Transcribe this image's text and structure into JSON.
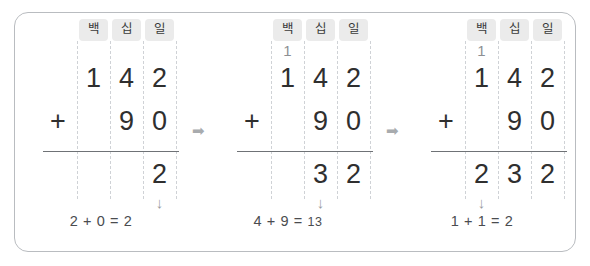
{
  "problem": {
    "addend_top": "142",
    "addend_bottom": "90",
    "total": "232",
    "operator": "+"
  },
  "place_headers": {
    "hundreds": "백",
    "tens": "십",
    "ones": "일"
  },
  "separator": {
    "arrow": "➡"
  },
  "down_arrow": "↓",
  "steps": [
    {
      "name": "step-ones",
      "carry": {
        "hundreds": "",
        "tens": "",
        "ones": ""
      },
      "addend1": {
        "hundreds": "1",
        "tens": "4",
        "ones": "2"
      },
      "addend2": {
        "hundreds": "",
        "tens": "9",
        "ones": "0"
      },
      "sum": {
        "hundreds": "",
        "tens": "",
        "ones": "2"
      },
      "operator": "+",
      "focus_column": "ones",
      "caption_left": "2 + 0 = ",
      "caption_result": "2"
    },
    {
      "name": "step-tens",
      "carry": {
        "hundreds": "1",
        "tens": "",
        "ones": ""
      },
      "addend1": {
        "hundreds": "1",
        "tens": "4",
        "ones": "2"
      },
      "addend2": {
        "hundreds": "",
        "tens": "9",
        "ones": "0"
      },
      "sum": {
        "hundreds": "",
        "tens": "3",
        "ones": "2"
      },
      "operator": "+",
      "focus_column": "tens",
      "caption_left": "4 + 9 = ",
      "caption_result": "13"
    },
    {
      "name": "step-hundreds",
      "carry": {
        "hundreds": "1",
        "tens": "",
        "ones": ""
      },
      "addend1": {
        "hundreds": "1",
        "tens": "4",
        "ones": "2"
      },
      "addend2": {
        "hundreds": "",
        "tens": "9",
        "ones": "0"
      },
      "sum": {
        "hundreds": "2",
        "tens": "3",
        "ones": "2"
      },
      "operator": "+",
      "focus_column": "hundreds",
      "caption_left": "1 + 1 = ",
      "caption_result": "2"
    }
  ],
  "colors": {
    "digit": "#2f2f2f",
    "carry_digit": "#8d8f93",
    "chip_background": "#ebebeb",
    "dashed_line": "#cfd2d6",
    "sum_bar": "#6f7276",
    "frame_border": "#b9bcc0",
    "arrow": "#a8abae"
  }
}
